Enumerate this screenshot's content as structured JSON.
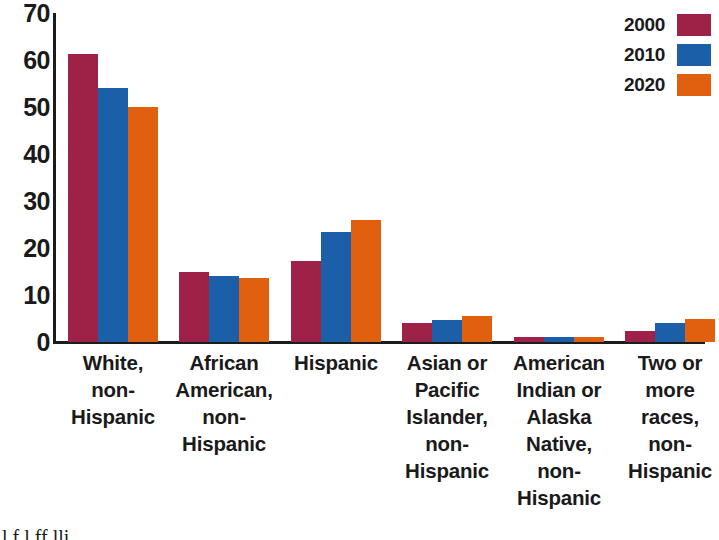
{
  "chart_data": {
    "type": "bar",
    "title": "",
    "xlabel": "",
    "ylabel": "",
    "ylim": [
      0,
      70
    ],
    "yticks": [
      70,
      60,
      50,
      40,
      30,
      20,
      10,
      0
    ],
    "grid": false,
    "legend_position": "top-right",
    "categories": [
      "White, non-Hispanic",
      "African American, non-Hispanic",
      "Hispanic",
      "Asian or Pacific Islander, non-Hispanic",
      "American Indian or Alaska Native, non-Hispanic",
      "Two or more races, non-Hispanic"
    ],
    "category_lines": [
      [
        "White,",
        "non-",
        "Hispanic"
      ],
      [
        "African",
        "American,",
        "non-",
        "Hispanic"
      ],
      [
        "Hispanic"
      ],
      [
        "Asian or",
        "Pacific",
        "Islander,",
        "non-",
        "Hispanic"
      ],
      [
        "American",
        "Indian or",
        "Alaska",
        "Native,",
        "non-",
        "Hispanic"
      ],
      [
        "Two or",
        "more",
        "races,",
        "non-",
        "Hispanic"
      ]
    ],
    "series": [
      {
        "name": "2000",
        "color": "#9e2248",
        "values": [
          61.3,
          15.0,
          17.3,
          4.0,
          1.1,
          2.3
        ]
      },
      {
        "name": "2010",
        "color": "#1b5fa8",
        "values": [
          54.0,
          14.0,
          23.4,
          4.7,
          1.0,
          4.0
        ]
      },
      {
        "name": "2020",
        "color": "#e06010",
        "values": [
          50.0,
          13.6,
          25.9,
          5.6,
          1.0,
          5.0
        ]
      }
    ]
  },
  "legend": {
    "entries": [
      {
        "label": "2000",
        "color": "#9e2248"
      },
      {
        "label": "2010",
        "color": "#1b5fa8"
      },
      {
        "label": "2020",
        "color": "#e06010"
      }
    ]
  },
  "axis": {
    "y_tick_labels": [
      "70",
      "60",
      "50",
      "40",
      "30",
      "20",
      "10",
      "0"
    ]
  },
  "page_fragment": {
    "text": "l f l ff lli"
  }
}
